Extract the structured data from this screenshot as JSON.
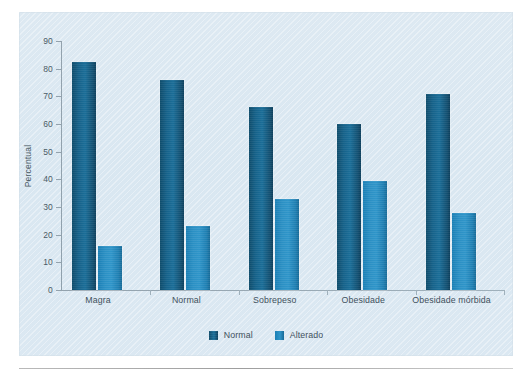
{
  "chart_data": {
    "type": "bar",
    "title": "",
    "xlabel": "",
    "ylabel": "Percentual",
    "ylim": [
      0,
      90
    ],
    "ytick_step": 10,
    "yticks": [
      "90",
      "80",
      "70",
      "60",
      "50",
      "40",
      "30",
      "20",
      "10",
      "0"
    ],
    "grid": false,
    "legend_position": "bottom-center",
    "categories": [
      "Magra",
      "Normal",
      "Sobrepeso",
      "Obesidade",
      "Obesidade mórbida"
    ],
    "series": [
      {
        "name": "Normal",
        "color": "#14608a",
        "values": [
          82.5,
          76,
          66,
          60,
          71
        ]
      },
      {
        "name": "Alterado",
        "color": "#2a8fc3",
        "values": [
          16,
          23,
          33,
          39.5,
          28
        ]
      }
    ]
  },
  "legend": {
    "items": [
      {
        "label": "Normal",
        "swatch": "legend-swatch-normal"
      },
      {
        "label": "Alterado",
        "swatch": "legend-swatch-alterado"
      }
    ]
  },
  "panel": {
    "background_color": "#dbe7f1",
    "axis_color": "#93a2ad",
    "text_color": "#3f515d"
  }
}
